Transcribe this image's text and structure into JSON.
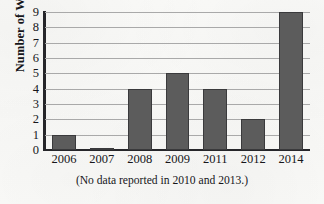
{
  "chart_data": {
    "type": "bar",
    "title": "",
    "subtitle": "",
    "xlabel": "",
    "ylabel": "Number of Words",
    "categories": [
      "2006",
      "2007",
      "2008",
      "2009",
      "2011",
      "2012",
      "2014"
    ],
    "values": [
      1,
      0.1,
      4,
      5,
      4,
      2,
      9
    ],
    "series": [
      {
        "name": "Number of Words",
        "values": [
          1,
          0.1,
          4,
          5,
          4,
          2,
          9
        ]
      }
    ],
    "ylim": [
      0,
      9
    ],
    "xlim_categories": 7,
    "y_ticks": [
      0,
      1,
      2,
      3,
      4,
      5,
      6,
      7,
      8,
      9
    ],
    "y_tick_labels": [
      "0",
      "1",
      "2",
      "3",
      "4",
      "5",
      "6",
      "7",
      "8",
      "9"
    ],
    "x_tick_labels": [
      "2006",
      "2007",
      "2008",
      "2009",
      "2011",
      "2012",
      "2014"
    ],
    "grid": true,
    "grid_axis": "y",
    "legend": false,
    "legend_position": "none",
    "annotations": [
      "(No data reported in 2010 and 2013.)"
    ],
    "bar_color": "#5c5c5c",
    "bar_edge_color": "#3a3a3c",
    "axis_color": "#26262a",
    "gridline_color": "#a9a9a9",
    "background_color": "#fbfbf9",
    "text_color": "#16161a"
  },
  "caption": {
    "text": "(No data reported in 2010 and 2013.)"
  }
}
